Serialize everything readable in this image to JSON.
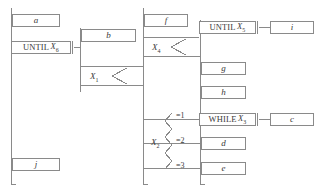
{
  "diagram": {
    "stroke_color": "#8a8a8a",
    "text_color": "#3a3a3a",
    "background_color": "#ffffff"
  },
  "process_boxes": [
    {
      "id": "a",
      "label": "a",
      "x": 12,
      "y": 14,
      "w": 48,
      "h": 13
    },
    {
      "id": "b",
      "label": "b",
      "x": 81,
      "y": 29,
      "w": 55,
      "h": 13
    },
    {
      "id": "f",
      "label": "f",
      "x": 144,
      "y": 14,
      "w": 44,
      "h": 13
    },
    {
      "id": "i",
      "label": "i",
      "x": 270,
      "y": 21,
      "w": 44,
      "h": 13
    },
    {
      "id": "g",
      "label": "g",
      "x": 201,
      "y": 62,
      "w": 45,
      "h": 13
    },
    {
      "id": "h",
      "label": "h",
      "x": 201,
      "y": 86,
      "w": 45,
      "h": 13
    },
    {
      "id": "c",
      "label": "c",
      "x": 270,
      "y": 113,
      "w": 44,
      "h": 13
    },
    {
      "id": "d",
      "label": "d",
      "x": 201,
      "y": 137,
      "w": 45,
      "h": 13
    },
    {
      "id": "e",
      "label": "e",
      "x": 201,
      "y": 162,
      "w": 45,
      "h": 13
    },
    {
      "id": "j",
      "label": "j",
      "x": 12,
      "y": 158,
      "w": 48,
      "h": 13
    }
  ],
  "keyword_boxes": [
    {
      "id": "until-x6",
      "keyword": "UNTIL",
      "variable": "X",
      "subscript": "6",
      "x": 11,
      "y": 41,
      "w": 60,
      "h": 13
    },
    {
      "id": "until-x5",
      "keyword": "UNTIL",
      "variable": "X",
      "subscript": "5",
      "x": 199,
      "y": 21,
      "w": 57,
      "h": 13
    },
    {
      "id": "while-x3",
      "keyword": "WHILE",
      "variable": "X",
      "subscript": "3",
      "x": 199,
      "y": 113,
      "w": 57,
      "h": 13
    }
  ],
  "decisions": [
    {
      "id": "x1",
      "variable": "X",
      "subscript": "1",
      "x": 90,
      "y": 74
    },
    {
      "id": "x4",
      "variable": "X",
      "subscript": "4",
      "x": 152,
      "y": 45
    },
    {
      "id": "x2",
      "variable": "X",
      "subscript": "2",
      "x": 151,
      "y": 140
    }
  ],
  "case_labels": [
    {
      "id": "case-1",
      "label": "=1",
      "x": 176,
      "y": 112
    },
    {
      "id": "case-2",
      "label": "=2",
      "x": 176,
      "y": 137
    },
    {
      "id": "case-3",
      "label": "=3",
      "x": 176,
      "y": 162
    }
  ]
}
